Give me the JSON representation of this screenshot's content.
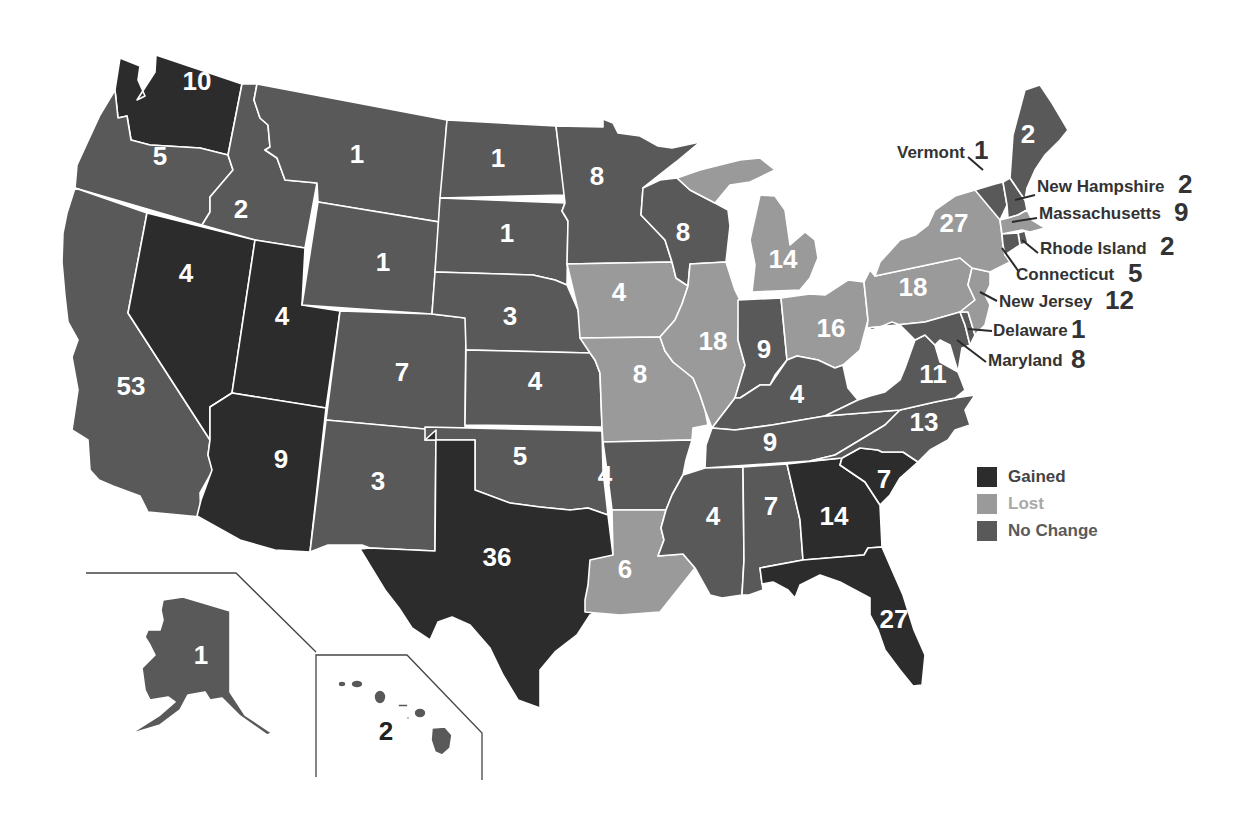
{
  "colors": {
    "gained": "#2c2c2c",
    "lost": "#9a9a9a",
    "no_change": "#595959",
    "border": "#ffffff",
    "label_dark": "#333333"
  },
  "legend": {
    "items": [
      {
        "key": "gained",
        "label": "Gained",
        "color": "#2c2c2c",
        "text_color": "#444444"
      },
      {
        "key": "lost",
        "label": "Lost",
        "color": "#9a9a9a",
        "text_color": "#a8a8a8"
      },
      {
        "key": "no_change",
        "label": "No Change",
        "color": "#595959",
        "text_color": "#5a5a5a"
      }
    ]
  },
  "states": {
    "WA": {
      "name": "Washington",
      "seats": "10",
      "status": "gained"
    },
    "OR": {
      "name": "Oregon",
      "seats": "5",
      "status": "no_change"
    },
    "CA": {
      "name": "California",
      "seats": "53",
      "status": "no_change"
    },
    "ID": {
      "name": "Idaho",
      "seats": "2",
      "status": "no_change"
    },
    "NV": {
      "name": "Nevada",
      "seats": "4",
      "status": "gained"
    },
    "UT": {
      "name": "Utah",
      "seats": "4",
      "status": "gained"
    },
    "AZ": {
      "name": "Arizona",
      "seats": "9",
      "status": "gained"
    },
    "MT": {
      "name": "Montana",
      "seats": "1",
      "status": "no_change"
    },
    "WY": {
      "name": "Wyoming",
      "seats": "1",
      "status": "no_change"
    },
    "CO": {
      "name": "Colorado",
      "seats": "7",
      "status": "no_change"
    },
    "NM": {
      "name": "New Mexico",
      "seats": "3",
      "status": "no_change"
    },
    "ND": {
      "name": "North Dakota",
      "seats": "1",
      "status": "no_change"
    },
    "SD": {
      "name": "South Dakota",
      "seats": "1",
      "status": "no_change"
    },
    "NE": {
      "name": "Nebraska",
      "seats": "3",
      "status": "no_change"
    },
    "KS": {
      "name": "Kansas",
      "seats": "4",
      "status": "no_change"
    },
    "OK": {
      "name": "Oklahoma",
      "seats": "5",
      "status": "no_change"
    },
    "TX": {
      "name": "Texas",
      "seats": "36",
      "status": "gained"
    },
    "MN": {
      "name": "Minnesota",
      "seats": "8",
      "status": "no_change"
    },
    "IA": {
      "name": "Iowa",
      "seats": "4",
      "status": "lost"
    },
    "MO": {
      "name": "Missouri",
      "seats": "8",
      "status": "lost"
    },
    "AR": {
      "name": "Arkansas",
      "seats": "4",
      "status": "no_change"
    },
    "LA": {
      "name": "Louisiana",
      "seats": "6",
      "status": "lost"
    },
    "WI": {
      "name": "Wisconsin",
      "seats": "8",
      "status": "no_change"
    },
    "IL": {
      "name": "Illinois",
      "seats": "18",
      "status": "lost"
    },
    "MI": {
      "name": "Michigan",
      "seats": "14",
      "status": "lost"
    },
    "IN": {
      "name": "Indiana",
      "seats": "9",
      "status": "no_change"
    },
    "OH": {
      "name": "Ohio",
      "seats": "16",
      "status": "lost"
    },
    "KY": {
      "name": "Kentucky",
      "seats": "6",
      "status": "no_change"
    },
    "TN": {
      "name": "Tennessee",
      "seats": "9",
      "status": "no_change"
    },
    "MS": {
      "name": "Mississippi",
      "seats": "4",
      "status": "no_change"
    },
    "AL": {
      "name": "Alabama",
      "seats": "7",
      "status": "no_change"
    },
    "GA": {
      "name": "Georgia",
      "seats": "14",
      "status": "gained"
    },
    "FL": {
      "name": "Florida",
      "seats": "27",
      "status": "gained"
    },
    "SC": {
      "name": "South Carolina",
      "seats": "7",
      "status": "gained"
    },
    "NC": {
      "name": "North Carolina",
      "seats": "13",
      "status": "no_change"
    },
    "VA": {
      "name": "Virginia",
      "seats": "11",
      "status": "no_change"
    },
    "WV": {
      "name": "West Virginia",
      "seats": "3",
      "status": "no_change"
    },
    "PA": {
      "name": "Pennsylvania",
      "seats": "18",
      "status": "lost"
    },
    "NY": {
      "name": "New York",
      "seats": "27",
      "status": "lost"
    },
    "VT": {
      "name": "Vermont",
      "seats": "1",
      "status": "no_change"
    },
    "NH": {
      "name": "New Hampshire",
      "seats": "2",
      "status": "no_change"
    },
    "ME": {
      "name": "Maine",
      "seats": "2",
      "status": "no_change"
    },
    "MA": {
      "name": "Massachusetts",
      "seats": "9",
      "status": "lost"
    },
    "RI": {
      "name": "Rhode Island",
      "seats": "2",
      "status": "no_change"
    },
    "CT": {
      "name": "Connecticut",
      "seats": "5",
      "status": "no_change"
    },
    "NJ": {
      "name": "New Jersey",
      "seats": "12",
      "status": "lost"
    },
    "DE": {
      "name": "Delaware",
      "seats": "1",
      "status": "no_change"
    },
    "MD": {
      "name": "Maryland",
      "seats": "8",
      "status": "no_change"
    },
    "AK": {
      "name": "Alaska",
      "seats": "1",
      "status": "no_change"
    },
    "HI": {
      "name": "Hawaii",
      "seats": "2",
      "status": "no_change"
    }
  },
  "callouts": {
    "VT": {
      "label": "Vermont",
      "seats": "1"
    },
    "NH": {
      "label": "New Hampshire",
      "seats": "2"
    },
    "MA": {
      "label": "Massachusetts",
      "seats": "9"
    },
    "RI": {
      "label": "Rhode Island",
      "seats": "2"
    },
    "CT": {
      "label": "Connecticut",
      "seats": "5"
    },
    "NJ": {
      "label": "New Jersey",
      "seats": "12"
    },
    "DE": {
      "label": "Delaware",
      "seats": "1"
    },
    "MD": {
      "label": "Maryland",
      "seats": "8"
    }
  }
}
